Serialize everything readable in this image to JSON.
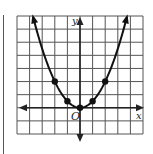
{
  "chart_data": {
    "type": "line",
    "title": "",
    "xlabel": "x",
    "ylabel": "y",
    "origin_label": "O",
    "function": "y = x^2 / 2",
    "xlim": [
      -5,
      5
    ],
    "ylim": [
      -2,
      7
    ],
    "grid": true,
    "grid_step": 1,
    "points": [
      {
        "x": -2,
        "y": 2
      },
      {
        "x": -1,
        "y": 0.5
      },
      {
        "x": 0,
        "y": 0
      },
      {
        "x": 1,
        "y": 0.5
      },
      {
        "x": 2,
        "y": 2
      }
    ],
    "curve_color": "#111111",
    "grid_color": "#555555"
  },
  "labels": {
    "x_axis": "x",
    "y_axis": "y",
    "origin": "O"
  }
}
